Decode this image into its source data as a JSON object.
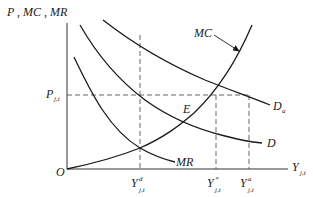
{
  "diagram": {
    "y_axis_label": "P , MC , MR",
    "x_axis_label": "Y",
    "x_axis_label_sub": "j,t",
    "origin_label": "O",
    "price_label": "P",
    "price_label_sub": "j,t",
    "equilibrium_label": "E",
    "curves": {
      "mc": "MC",
      "mr": "MR",
      "d": "D",
      "da": "D",
      "da_sub": "a"
    },
    "x_ticks": [
      {
        "label": "Y",
        "sup": "d",
        "sub": "j,t"
      },
      {
        "label": "Y",
        "sup": "*",
        "sub": "j,t"
      },
      {
        "label": "Y",
        "sup": "a",
        "sub": "j,t"
      }
    ],
    "colors": {
      "curve": "#1a1a1a",
      "axis": "#333333",
      "dashed": "#555555",
      "background": "#ffffff"
    }
  }
}
